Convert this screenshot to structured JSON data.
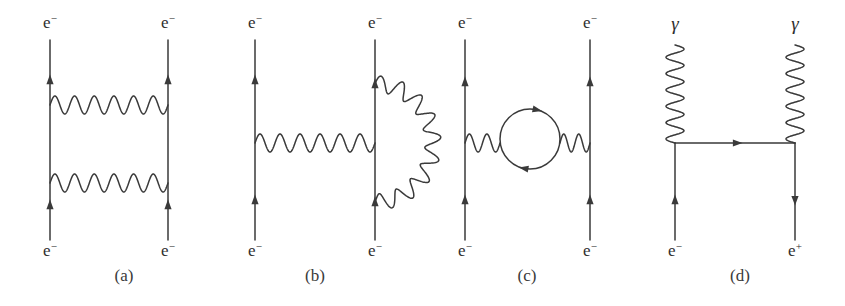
{
  "figure": {
    "background": "#ffffff",
    "line_color": "#3a3a3a",
    "text_color": "#2e2e2e",
    "width": 845,
    "height": 306
  },
  "panels": [
    {
      "id": "a",
      "caption": "(a)",
      "caption_x": 124,
      "caption_y": 281,
      "process": "two-photon-exchange-ladder",
      "left_line_x": 50,
      "right_line_x": 168,
      "line_top_y": 40,
      "line_bottom_y": 240,
      "photons": [
        {
          "name": "photon-upper",
          "y": 105,
          "x1": 50,
          "x2": 168,
          "cycles": 6,
          "amplitude": 9
        },
        {
          "name": "photon-lower",
          "y": 183,
          "x1": 50,
          "x2": 168,
          "cycles": 6,
          "amplitude": 9
        }
      ],
      "arrows": [
        {
          "x": 50,
          "y": 80,
          "dir": "up"
        },
        {
          "x": 168,
          "y": 80,
          "dir": "up"
        },
        {
          "x": 50,
          "y": 205,
          "dir": "up"
        },
        {
          "x": 168,
          "y": 205,
          "dir": "up"
        }
      ],
      "labels": [
        {
          "name": "label-top-left",
          "text": "e",
          "sup": "−",
          "x": 50,
          "y": 28
        },
        {
          "name": "label-top-right",
          "text": "e",
          "sup": "−",
          "x": 168,
          "y": 28
        },
        {
          "name": "label-bottom-left",
          "text": "e",
          "sup": "−",
          "x": 50,
          "y": 256
        },
        {
          "name": "label-bottom-right",
          "text": "e",
          "sup": "−",
          "x": 168,
          "y": 256
        }
      ]
    },
    {
      "id": "b",
      "caption": "(b)",
      "caption_x": 315,
      "caption_y": 281,
      "process": "self-energy-correction",
      "left_line_x": 255,
      "right_line_x": 375,
      "line_top_y": 40,
      "line_bottom_y": 240,
      "photons": [
        {
          "name": "photon-exchange",
          "y": 143,
          "x1": 255,
          "x2": 375,
          "cycles": 6,
          "amplitude": 9
        }
      ],
      "loop": {
        "name": "photon-self-energy-loop",
        "cx": 375,
        "cy": 143,
        "rx": 58,
        "ry": 59,
        "start_y": 84,
        "end_y": 202,
        "cycles": 9,
        "amplitude": 8
      },
      "arrows": [
        {
          "x": 255,
          "y": 80,
          "dir": "up"
        },
        {
          "x": 375,
          "y": 84,
          "dir": "up"
        },
        {
          "x": 255,
          "y": 200,
          "dir": "up"
        },
        {
          "x": 375,
          "y": 202,
          "dir": "up"
        }
      ],
      "labels": [
        {
          "name": "label-top-left",
          "text": "e",
          "sup": "−",
          "x": 255,
          "y": 28
        },
        {
          "name": "label-top-right",
          "text": "e",
          "sup": "−",
          "x": 375,
          "y": 28
        },
        {
          "name": "label-bottom-left",
          "text": "e",
          "sup": "−",
          "x": 255,
          "y": 256
        },
        {
          "name": "label-bottom-right",
          "text": "e",
          "sup": "−",
          "x": 375,
          "y": 256
        }
      ]
    },
    {
      "id": "c",
      "caption": "(c)",
      "caption_x": 527,
      "caption_y": 281,
      "process": "vacuum-polarization",
      "left_line_x": 465,
      "right_line_x": 590,
      "line_top_y": 40,
      "line_bottom_y": 240,
      "photons": [
        {
          "name": "photon-left-segment",
          "y": 143,
          "x1": 465,
          "x2": 500,
          "cycles": 2,
          "amplitude": 9
        },
        {
          "name": "photon-right-segment",
          "y": 143,
          "x1": 560,
          "x2": 590,
          "cycles": 2,
          "amplitude": 9
        }
      ],
      "fermion_loop": {
        "name": "fermion-loop",
        "cx": 530,
        "cy": 139,
        "r": 30,
        "arrow_top": {
          "angle": -78,
          "dir": "cw"
        },
        "arrow_bottom": {
          "angle": 100,
          "dir": "cw"
        }
      },
      "arrows": [
        {
          "x": 465,
          "y": 82,
          "dir": "up"
        },
        {
          "x": 590,
          "y": 82,
          "dir": "up"
        },
        {
          "x": 465,
          "y": 200,
          "dir": "up"
        },
        {
          "x": 590,
          "y": 200,
          "dir": "up"
        }
      ],
      "labels": [
        {
          "name": "label-top-left",
          "text": "e",
          "sup": "−",
          "x": 465,
          "y": 28
        },
        {
          "name": "label-top-right",
          "text": "e",
          "sup": "−",
          "x": 590,
          "y": 28
        },
        {
          "name": "label-bottom-left",
          "text": "e",
          "sup": "−",
          "x": 465,
          "y": 256
        },
        {
          "name": "label-bottom-right",
          "text": "e",
          "sup": "−",
          "x": 590,
          "y": 256
        }
      ]
    },
    {
      "id": "d",
      "caption": "(d)",
      "caption_x": 740,
      "caption_y": 281,
      "process": "pair-annihilation-two-photon",
      "left_line_x": 675,
      "right_line_x": 795,
      "line_top_y": 143,
      "line_bottom_y": 240,
      "fermion_horizontal": {
        "name": "fermion-horizontal",
        "y": 143,
        "x1": 675,
        "x2": 795,
        "arrow_x": 737,
        "dir": "right"
      },
      "photons": [
        {
          "name": "photon-left-vertical",
          "x": 675,
          "y1": 45,
          "y2": 143,
          "cycles": 6,
          "amplitude": 9
        },
        {
          "name": "photon-right-vertical",
          "x": 795,
          "y1": 45,
          "y2": 143,
          "cycles": 6,
          "amplitude": 9
        }
      ],
      "arrows": [
        {
          "x": 675,
          "y": 200,
          "dir": "up"
        },
        {
          "x": 795,
          "y": 200,
          "dir": "down"
        }
      ],
      "labels": [
        {
          "name": "label-top-left-photon",
          "text": "γ",
          "sup": "",
          "x": 675,
          "y": 30,
          "italic": true
        },
        {
          "name": "label-top-right-photon",
          "text": "γ",
          "sup": "",
          "x": 795,
          "y": 30,
          "italic": true
        },
        {
          "name": "label-bottom-left",
          "text": "e",
          "sup": "−",
          "x": 675,
          "y": 256
        },
        {
          "name": "label-bottom-right",
          "text": "e",
          "sup": "+",
          "x": 795,
          "y": 256
        }
      ]
    }
  ]
}
